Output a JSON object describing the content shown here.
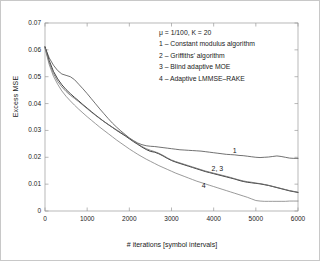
{
  "chart_data": {
    "type": "line",
    "title": "",
    "xlabel": "# iterations [symbol intervals]",
    "ylabel": "Excess MSE",
    "xlim": [
      0,
      6000
    ],
    "ylim": [
      0,
      0.07
    ],
    "xticks": [
      0,
      1000,
      2000,
      3000,
      4000,
      5000,
      6000
    ],
    "xticklabels": [
      "0",
      "1000",
      "2000",
      "3000",
      "4000",
      "5000",
      "6000"
    ],
    "yticks": [
      0,
      0.01,
      0.02,
      0.03,
      0.04,
      0.05,
      0.06,
      0.07
    ],
    "yticklabels": [
      "0",
      "0.01",
      "0.02",
      "0.03",
      "0.04",
      "0.05",
      "0.06",
      "0.07"
    ],
    "grid": false,
    "legend_position": "upper-right-inside-text",
    "annotations": [
      {
        "text": "1",
        "x": 4450,
        "y": 0.0222
      },
      {
        "text": "2, 3",
        "x": 3950,
        "y": 0.0158
      },
      {
        "text": "4",
        "x": 3720,
        "y": 0.0092
      }
    ],
    "legend_text": [
      "μ  = 1/100,  K = 20",
      "1 – Constant modulus algorithm",
      "2 – Griffiths' algorithm",
      "3 – Blind adaptive MOE",
      "4 – Adaptive LMMSE–RAKE"
    ],
    "series": [
      {
        "name": "1 - Constant modulus algorithm",
        "label": "1",
        "color": "#4d4d4d",
        "x": [
          0,
          100,
          200,
          300,
          400,
          500,
          600,
          700,
          800,
          900,
          1000,
          1100,
          1200,
          1300,
          1400,
          1500,
          1600,
          1700,
          1800,
          1900,
          2000,
          2100,
          2200,
          2300,
          2400,
          2500,
          2600,
          2700,
          2800,
          2900,
          3000,
          3100,
          3200,
          3300,
          3400,
          3500,
          3600,
          3700,
          3800,
          3900,
          4000,
          4100,
          4200,
          4300,
          4400,
          4500,
          4600,
          4700,
          4800,
          4900,
          5000,
          5100,
          5200,
          5300,
          5400,
          5500,
          5600,
          5700,
          5800,
          5900,
          6000
        ],
        "y": [
          0.061,
          0.057,
          0.0543,
          0.0523,
          0.051,
          0.0505,
          0.05,
          0.0489,
          0.0472,
          0.0455,
          0.0437,
          0.0418,
          0.0399,
          0.038,
          0.0362,
          0.0344,
          0.0327,
          0.0312,
          0.0298,
          0.0285,
          0.0272,
          0.0262,
          0.0253,
          0.0247,
          0.0243,
          0.0241,
          0.024,
          0.0238,
          0.0236,
          0.0234,
          0.0232,
          0.023,
          0.0228,
          0.0227,
          0.0226,
          0.0225,
          0.0224,
          0.0223,
          0.0221,
          0.0219,
          0.0217,
          0.0215,
          0.0213,
          0.0211,
          0.021,
          0.0209,
          0.0207,
          0.0206,
          0.0204,
          0.0202,
          0.02,
          0.0199,
          0.02,
          0.0201,
          0.0203,
          0.0205,
          0.0203,
          0.02,
          0.0197,
          0.0196,
          0.0196
        ]
      },
      {
        "name": "2 - Griffiths' algorithm",
        "label": "2",
        "color": "#333333",
        "x": [
          0,
          100,
          200,
          300,
          400,
          500,
          600,
          700,
          800,
          900,
          1000,
          1100,
          1200,
          1300,
          1400,
          1500,
          1600,
          1700,
          1800,
          1900,
          2000,
          2100,
          2200,
          2300,
          2400,
          2500,
          2600,
          2700,
          2800,
          2900,
          3000,
          3100,
          3200,
          3300,
          3400,
          3500,
          3600,
          3700,
          3800,
          3900,
          4000,
          4100,
          4200,
          4300,
          4400,
          4500,
          4600,
          4700,
          4800,
          4900,
          5000,
          5100,
          5200,
          5300,
          5400,
          5500,
          5600,
          5700,
          5800,
          5900,
          6000
        ],
        "y": [
          0.0612,
          0.056,
          0.052,
          0.0492,
          0.047,
          0.0452,
          0.0437,
          0.0423,
          0.041,
          0.0396,
          0.0383,
          0.037,
          0.0357,
          0.0345,
          0.0333,
          0.0322,
          0.0311,
          0.03,
          0.029,
          0.028,
          0.0269,
          0.0258,
          0.0248,
          0.0238,
          0.0229,
          0.0222,
          0.0219,
          0.0213,
          0.0205,
          0.0196,
          0.0188,
          0.0182,
          0.0177,
          0.0172,
          0.0167,
          0.0162,
          0.0157,
          0.0152,
          0.0147,
          0.0143,
          0.0139,
          0.0135,
          0.0131,
          0.0127,
          0.0123,
          0.0119,
          0.0114,
          0.011,
          0.0107,
          0.0105,
          0.0103,
          0.0101,
          0.0098,
          0.0095,
          0.0091,
          0.0087,
          0.0083,
          0.0079,
          0.0075,
          0.0072,
          0.0069
        ]
      },
      {
        "name": "3 - Blind adaptive MOE",
        "label": "3",
        "color": "#6b6b6b",
        "x": [
          0,
          100,
          200,
          300,
          400,
          500,
          600,
          700,
          800,
          900,
          1000,
          1100,
          1200,
          1300,
          1400,
          1500,
          1600,
          1700,
          1800,
          1900,
          2000,
          2100,
          2200,
          2300,
          2400,
          2500,
          2600,
          2700,
          2800,
          2900,
          3000,
          3100,
          3200,
          3300,
          3400,
          3500,
          3600,
          3700,
          3800,
          3900,
          4000,
          4100,
          4200,
          4300,
          4400,
          4500,
          4600,
          4700,
          4800,
          4900,
          5000,
          5100,
          5200,
          5300,
          5400,
          5500,
          5600,
          5700,
          5800,
          5900,
          6000
        ],
        "y": [
          0.0608,
          0.0552,
          0.0512,
          0.0483,
          0.0462,
          0.0445,
          0.0431,
          0.0419,
          0.0407,
          0.0394,
          0.0381,
          0.0368,
          0.0356,
          0.0344,
          0.0333,
          0.0322,
          0.0312,
          0.0302,
          0.0292,
          0.0282,
          0.0271,
          0.026,
          0.025,
          0.024,
          0.0232,
          0.0226,
          0.0221,
          0.0215,
          0.0207,
          0.0198,
          0.019,
          0.0184,
          0.0179,
          0.0174,
          0.0169,
          0.0164,
          0.0159,
          0.0154,
          0.0149,
          0.0145,
          0.0141,
          0.0137,
          0.0133,
          0.0129,
          0.0125,
          0.012,
          0.0116,
          0.0112,
          0.0109,
          0.0107,
          0.0104,
          0.0102,
          0.0099,
          0.0096,
          0.0092,
          0.0088,
          0.0084,
          0.008,
          0.0076,
          0.0073,
          0.007
        ]
      },
      {
        "name": "4 - Adaptive LMMSE-RAKE",
        "label": "4",
        "color": "#808080",
        "x": [
          0,
          100,
          200,
          300,
          400,
          500,
          600,
          700,
          800,
          900,
          1000,
          1100,
          1200,
          1300,
          1400,
          1500,
          1600,
          1700,
          1800,
          1900,
          2000,
          2100,
          2200,
          2300,
          2400,
          2500,
          2600,
          2700,
          2800,
          2900,
          3000,
          3100,
          3200,
          3300,
          3400,
          3500,
          3600,
          3700,
          3800,
          3900,
          4000,
          4100,
          4200,
          4300,
          4400,
          4500,
          4600,
          4700,
          4800,
          4900,
          5000,
          5100,
          5200,
          5300,
          5400,
          5500,
          5600,
          5700,
          5800,
          5900,
          6000
        ],
        "y": [
          0.0606,
          0.0545,
          0.0502,
          0.0472,
          0.0447,
          0.0427,
          0.041,
          0.0394,
          0.0379,
          0.0365,
          0.0351,
          0.0338,
          0.0325,
          0.0312,
          0.03,
          0.0288,
          0.0276,
          0.0264,
          0.0253,
          0.0242,
          0.0231,
          0.0221,
          0.0211,
          0.0202,
          0.0193,
          0.0185,
          0.0177,
          0.0169,
          0.0162,
          0.0155,
          0.0148,
          0.0141,
          0.0135,
          0.0129,
          0.0123,
          0.0117,
          0.0111,
          0.0106,
          0.0101,
          0.0096,
          0.0091,
          0.0086,
          0.0081,
          0.0076,
          0.0071,
          0.0066,
          0.0061,
          0.0056,
          0.0051,
          0.0045,
          0.0039,
          0.0037,
          0.0036,
          0.0036,
          0.0036,
          0.0036,
          0.0036,
          0.0036,
          0.0037,
          0.0037,
          0.0037
        ]
      }
    ]
  }
}
